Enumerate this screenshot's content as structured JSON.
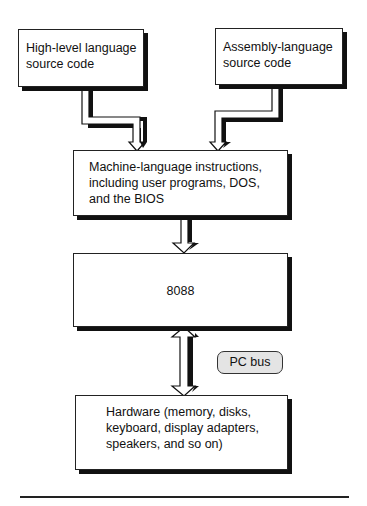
{
  "diagram": {
    "type": "flowchart",
    "nodes": [
      {
        "id": "high_level",
        "label": "High-level language\nsource code"
      },
      {
        "id": "assembly",
        "label": "Assembly-language\nsource code"
      },
      {
        "id": "machine",
        "label": "Machine-language instructions,\nincluding user programs, DOS,\nand the BIOS"
      },
      {
        "id": "cpu",
        "label": "8088"
      },
      {
        "id": "hardware",
        "label": "Hardware (memory, disks,\nkeyboard, display adapters,\nspeakers, and so on)"
      }
    ],
    "edges": [
      {
        "from": "high_level",
        "to": "machine",
        "direction": "one-way"
      },
      {
        "from": "assembly",
        "to": "machine",
        "direction": "one-way"
      },
      {
        "from": "machine",
        "to": "cpu",
        "direction": "one-way"
      },
      {
        "from": "cpu",
        "to": "hardware",
        "direction": "two-way",
        "label": "PC bus"
      }
    ],
    "bus_label": "PC bus"
  },
  "colors": {
    "box_fill": "#ffffff",
    "box_border": "#222222",
    "shadow": "#111111",
    "pill_fill": "#e4e4e4"
  }
}
